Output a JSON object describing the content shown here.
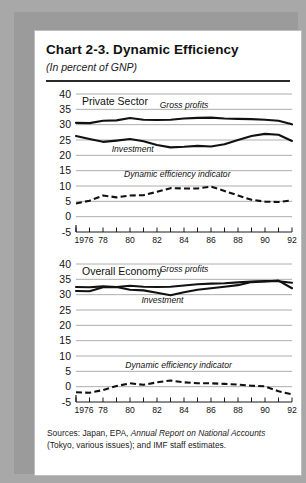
{
  "chart": {
    "title": "Chart 2-3.  Dynamic Efficiency",
    "subtitle": "(In percent of GNP)",
    "sources_line1": "Sources:  Japan, EPA, ",
    "sources_italic": "Annual Report on National Accounts",
    "sources_line1b": " (Tokyo,",
    "sources_line2": "various issues); and IMF staff estimates."
  },
  "chart_data": [
    {
      "type": "line",
      "title": "Private Sector",
      "panel_label": "Private Sector",
      "xlabel": "",
      "ylabel": "",
      "ylim": [
        -5,
        40
      ],
      "yticks": [
        40,
        35,
        30,
        25,
        20,
        15,
        10,
        5,
        0,
        -5
      ],
      "xlim": [
        1976,
        1992
      ],
      "xticks": [
        1976,
        1977,
        1978,
        1979,
        1980,
        1981,
        1982,
        1983,
        1984,
        1985,
        1986,
        1987,
        1988,
        1989,
        1990,
        1991,
        1992
      ],
      "xticklabels": [
        "1976",
        "",
        "78",
        "",
        "80",
        "",
        "82",
        "",
        "84",
        "",
        "86",
        "",
        "88",
        "",
        "90",
        "",
        "92"
      ],
      "grid": true,
      "legend": "inline-annotations",
      "x": [
        1976,
        1977,
        1978,
        1979,
        1980,
        1981,
        1982,
        1983,
        1984,
        1985,
        1986,
        1987,
        1988,
        1989,
        1990,
        1991,
        1992
      ],
      "series": [
        {
          "name": "Gross profits",
          "style": "solid",
          "values": [
            30.6,
            30.5,
            31.3,
            31.4,
            32.2,
            31.6,
            31.5,
            31.6,
            32.0,
            32.2,
            32.3,
            32.0,
            31.9,
            31.8,
            31.6,
            31.3,
            30.1
          ]
        },
        {
          "name": "Investment",
          "style": "solid",
          "values": [
            26.3,
            25.3,
            24.4,
            24.8,
            25.3,
            24.6,
            23.4,
            22.6,
            22.8,
            23.1,
            22.9,
            23.6,
            25.0,
            26.3,
            27.0,
            26.7,
            24.7
          ]
        },
        {
          "name": "Dynamic efficiency indicator",
          "style": "dashed",
          "values": [
            4.3,
            5.2,
            6.9,
            6.3,
            6.9,
            7.0,
            8.1,
            9.3,
            9.2,
            9.2,
            9.8,
            8.4,
            6.9,
            5.5,
            4.9,
            4.8,
            5.3
          ]
        }
      ],
      "annotations": [
        {
          "text": "Gross profits",
          "x": 1984.0,
          "y": 35.5
        },
        {
          "text": "Investment",
          "x": 1980.2,
          "y": 21.0
        },
        {
          "text": "Dynamic efficiency indicator",
          "x": 1983.5,
          "y": 13.0
        }
      ]
    },
    {
      "type": "line",
      "title": "Overall Economy",
      "panel_label": "Overall Economy",
      "xlabel": "",
      "ylabel": "",
      "ylim": [
        -5,
        40
      ],
      "yticks": [
        40,
        35,
        30,
        25,
        20,
        15,
        10,
        5,
        0,
        -5
      ],
      "xlim": [
        1976,
        1992
      ],
      "xticks": [
        1976,
        1977,
        1978,
        1979,
        1980,
        1981,
        1982,
        1983,
        1984,
        1985,
        1986,
        1987,
        1988,
        1989,
        1990,
        1991,
        1992
      ],
      "xticklabels": [
        "1976",
        "",
        "78",
        "",
        "80",
        "",
        "82",
        "",
        "84",
        "",
        "86",
        "",
        "88",
        "",
        "90",
        "",
        "92"
      ],
      "grid": true,
      "legend": "inline-annotations",
      "x": [
        1976,
        1977,
        1978,
        1979,
        1980,
        1981,
        1982,
        1983,
        1984,
        1985,
        1986,
        1987,
        1988,
        1989,
        1990,
        1991,
        1992
      ],
      "series": [
        {
          "name": "Gross profits",
          "style": "solid",
          "values": [
            32.5,
            32.4,
            32.7,
            32.5,
            32.9,
            32.6,
            32.5,
            32.6,
            33.0,
            33.4,
            33.6,
            33.7,
            34.0,
            34.3,
            34.4,
            34.4,
            33.9
          ]
        },
        {
          "name": "Investment",
          "style": "solid",
          "values": [
            31.2,
            31.1,
            32.4,
            32.5,
            31.6,
            31.4,
            30.6,
            29.8,
            30.8,
            31.6,
            32.1,
            32.6,
            33.1,
            34.1,
            34.3,
            34.6,
            32.1
          ]
        },
        {
          "name": "Dynamic efficiency indicator",
          "style": "dashed",
          "values": [
            -1.8,
            -2.0,
            -1.1,
            0.2,
            1.1,
            0.6,
            1.4,
            2.0,
            1.4,
            1.1,
            1.1,
            0.9,
            0.7,
            0.3,
            0.1,
            -1.5,
            -2.5
          ]
        }
      ],
      "annotations": [
        {
          "text": "Gross profits",
          "x": 1984.0,
          "y": 37.3
        },
        {
          "text": "Investment",
          "x": 1982.4,
          "y": 27.2
        },
        {
          "text": "Dynamic efficiency indicator",
          "x": 1983.6,
          "y": 6.2
        }
      ]
    }
  ]
}
